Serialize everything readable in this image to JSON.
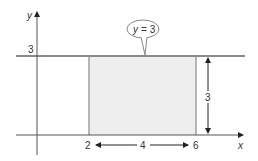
{
  "diagram": {
    "axes": {
      "x_label": "x",
      "y_label": "y"
    },
    "horizontal_line": {
      "equation_prefix": "y",
      "equals": "=",
      "value": "3",
      "callout": "y = 3"
    },
    "y_tick_label": "3",
    "rectangle": {
      "x_start_label": "2",
      "x_end_label": "6",
      "width_label": "4",
      "height_label": "3",
      "fill": "#eeeeee"
    },
    "colors": {
      "line": "#8a8a8a",
      "axis": "#555555",
      "text": "#333333"
    }
  }
}
